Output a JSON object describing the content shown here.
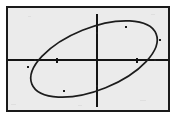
{
  "figure": {
    "kind": "graph-plot",
    "frame_color": "#1a1a1a",
    "plot_background": "#ebebeb",
    "curve_color": "#1c1c1c",
    "axis_color": "#141414"
  },
  "chart_data": {
    "type": "scatter",
    "title": "",
    "subtitle": "",
    "xlabel": "",
    "ylabel": "",
    "grid": false,
    "legend": false,
    "legend_position": "none",
    "axes": {
      "x_axis_pixel_y": 52,
      "y_axis_pixel_x": 89,
      "x_axis_span_px": [
        0,
        160
      ],
      "y_axis_span_px": [
        6,
        99
      ],
      "origin_px": [
        89,
        52
      ]
    },
    "tick_marks": {
      "x_ticks_px": [
        49,
        129
      ],
      "y_ticks_px": []
    },
    "curves": [
      {
        "name": "ellipse",
        "shape": "ellipse",
        "center_px": [
          86,
          51
        ],
        "semi_major_px": 67,
        "semi_minor_px": 31,
        "rotation_deg": -22,
        "closed": true,
        "extremes_px": {
          "leftmost": [
            20,
            59
          ],
          "rightmost": [
            152,
            32
          ],
          "topmost": [
            118,
            19
          ],
          "bottommost": [
            56,
            83
          ]
        },
        "axis_crossings_px": {
          "y_axis_upper": [
            89,
            25
          ],
          "y_axis_lower": [
            89,
            78
          ],
          "x_axis_left": [
            26,
            52
          ],
          "x_axis_right": [
            147,
            52
          ]
        },
        "node_markers_px": [
          [
            118,
            19
          ],
          [
            56,
            83
          ],
          [
            20,
            59
          ],
          [
            152,
            32
          ],
          [
            89,
            25
          ],
          [
            89,
            78
          ]
        ]
      }
    ]
  }
}
